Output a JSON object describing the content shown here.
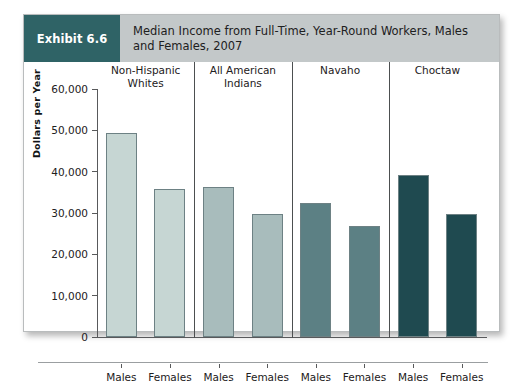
{
  "exhibit": {
    "badge_label": "Exhibit 6.6",
    "badge_color": "#2f6366",
    "header_bg": "#c3c8c9",
    "title": "Median Income from Full-Time, Year-Round Workers, Males and Females, 2007"
  },
  "chart_data": {
    "type": "bar",
    "title": "Median Income from Full-Time, Year-Round Workers, Males and Females, 2007",
    "xlabel": "",
    "ylabel": "Dollars per Year",
    "ylim": [
      0,
      60000
    ],
    "ytick_labels": [
      "60,000",
      "50,000",
      "40,000",
      "30,000",
      "20,000",
      "10,000",
      "0"
    ],
    "ytick_values": [
      60000,
      50000,
      40000,
      30000,
      20000,
      10000,
      0
    ],
    "grid": false,
    "legend": "none",
    "categories": [
      "Males",
      "Females"
    ],
    "groups": [
      {
        "name": "Non-Hispanic Whites",
        "name_lines": [
          "Non-Hispanic",
          "Whites"
        ],
        "color": "#c6d6d3",
        "bars": [
          {
            "label": "Males",
            "value": 49400
          },
          {
            "label": "Females",
            "value": 35900
          }
        ]
      },
      {
        "name": "All American Indians",
        "name_lines": [
          "All American",
          "Indians"
        ],
        "color": "#a8bcbc",
        "bars": [
          {
            "label": "Males",
            "value": 36300
          },
          {
            "label": "Females",
            "value": 29800
          }
        ]
      },
      {
        "name": "Navaho",
        "name_lines": [
          "Navaho"
        ],
        "color": "#5c8084",
        "bars": [
          {
            "label": "Males",
            "value": 32400
          },
          {
            "label": "Females",
            "value": 26800
          }
        ]
      },
      {
        "name": "Choctaw",
        "name_lines": [
          "Choctaw"
        ],
        "color": "#1f4a50",
        "bars": [
          {
            "label": "Males",
            "value": 39300
          },
          {
            "label": "Females",
            "value": 29800
          }
        ]
      }
    ]
  }
}
